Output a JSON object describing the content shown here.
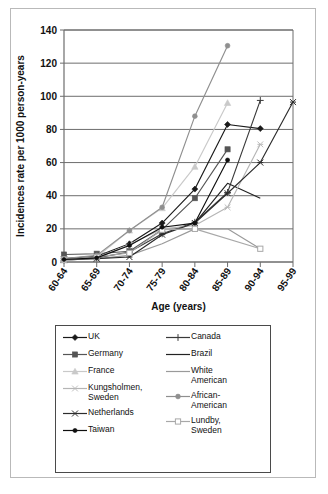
{
  "chart_data": {
    "type": "line",
    "title": "",
    "xlabel": "Age (years)",
    "ylabel": "Incidences rate per 1000 person-years",
    "categories": [
      "60-64",
      "65-69",
      "70-74",
      "75-79",
      "80-84",
      "85-89",
      "90-94",
      "95-99"
    ],
    "ylim": [
      0,
      140
    ],
    "yticks": [
      0,
      20,
      40,
      60,
      80,
      100,
      120,
      140
    ],
    "grid": true,
    "legend_position": "below",
    "series": [
      {
        "name": "UK",
        "color": "#1a1a1a",
        "marker": "diamond",
        "values": [
          2.0,
          3.5,
          11.0,
          23.5,
          44.0,
          83.0,
          80.5,
          null
        ]
      },
      {
        "name": "Canada",
        "color": "#3a3a3a",
        "marker": "plus",
        "values": [
          1.0,
          2.5,
          6.0,
          17.0,
          24.0,
          42.0,
          97.5,
          null
        ]
      },
      {
        "name": "Germany",
        "color": "#555555",
        "marker": "square",
        "values": [
          4.5,
          5.0,
          6.5,
          19.5,
          38.5,
          68.0,
          null,
          null
        ]
      },
      {
        "name": "Brazil",
        "color": "#222222",
        "marker": "none",
        "values": [
          null,
          null,
          null,
          null,
          23.5,
          47.5,
          38.5,
          null
        ]
      },
      {
        "name": "France",
        "color": "#c9c9c9",
        "marker": "triangle",
        "values": [
          1.0,
          3.0,
          19.0,
          32.5,
          57.5,
          96.0,
          null,
          null
        ]
      },
      {
        "name": "White American",
        "color": "#9a9a9a",
        "marker": "none",
        "values": [
          1.5,
          2.0,
          4.0,
          11.0,
          20.0,
          20.0,
          8.0,
          null
        ]
      },
      {
        "name": "Kungsholmen, Sweden",
        "color": "#b5b5b5",
        "marker": "star",
        "values": [
          1.0,
          2.5,
          10.5,
          20.0,
          22.0,
          33.0,
          71.0,
          null
        ]
      },
      {
        "name": "African-American",
        "color": "#8f8f8f",
        "marker": "circle",
        "values": [
          2.0,
          4.0,
          19.0,
          33.0,
          88.0,
          130.5,
          null,
          null
        ]
      },
      {
        "name": "Netherlands",
        "color": "#2c2c2c",
        "marker": "asterisk",
        "values": [
          1.5,
          2.0,
          3.0,
          16.5,
          23.5,
          41.5,
          60.0,
          96.5
        ]
      },
      {
        "name": "Lundby, Sweden",
        "color": "#a8a8a8",
        "marker": "open-square",
        "values": [
          1.5,
          3.0,
          5.5,
          19.5,
          20.0,
          null,
          8.0,
          null
        ]
      },
      {
        "name": "Taiwan",
        "color": "#0f0f0f",
        "marker": "dot",
        "values": [
          1.5,
          2.5,
          10.0,
          21.0,
          23.5,
          61.5,
          null,
          null
        ]
      }
    ]
  },
  "legend": {
    "columns": [
      [
        {
          "label": "UK",
          "series": 0
        },
        {
          "label": "Germany",
          "series": 2
        },
        {
          "label": "France",
          "series": 4
        },
        {
          "label": "Kungsholmen,\nSweden",
          "series": 6
        },
        {
          "label": "Netherlands",
          "series": 8
        },
        {
          "label": "Taiwan",
          "series": 10
        }
      ],
      [
        {
          "label": "Canada",
          "series": 1
        },
        {
          "label": "Brazil",
          "series": 3
        },
        {
          "label": "White\nAmerican",
          "series": 5
        },
        {
          "label": "African-\nAmerican",
          "series": 7
        },
        {
          "label": "Lundby,\nSweden",
          "series": 9
        }
      ]
    ]
  }
}
